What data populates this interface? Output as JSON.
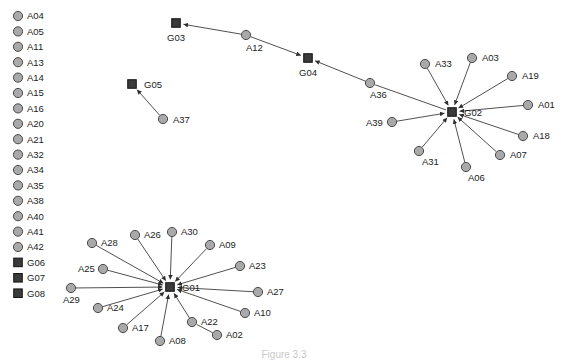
{
  "figure": {
    "type": "node-link-network-diagram",
    "background_color": "#ffffff",
    "width": 569,
    "height": 360,
    "caption": "Figure 3.3"
  },
  "style": {
    "actor_fill": "#a9a9a9",
    "actor_stroke": "#4a4a4a",
    "group_fill": "#3b3b3b",
    "group_stroke": "#1a1a1a",
    "edge_color": "#3c3c3c",
    "label_color": "#1b1b1b",
    "actor_radius": 4.6,
    "group_size": 8.5
  },
  "legend": {
    "name": "isolate-legend",
    "items": [
      {
        "label": "A04",
        "shape": "circle"
      },
      {
        "label": "A05",
        "shape": "circle"
      },
      {
        "label": "A11",
        "shape": "circle"
      },
      {
        "label": "A13",
        "shape": "circle"
      },
      {
        "label": "A14",
        "shape": "circle"
      },
      {
        "label": "A15",
        "shape": "circle"
      },
      {
        "label": "A16",
        "shape": "circle"
      },
      {
        "label": "A20",
        "shape": "circle"
      },
      {
        "label": "A21",
        "shape": "circle"
      },
      {
        "label": "A32",
        "shape": "circle"
      },
      {
        "label": "A34",
        "shape": "circle"
      },
      {
        "label": "A35",
        "shape": "circle"
      },
      {
        "label": "A38",
        "shape": "circle"
      },
      {
        "label": "A40",
        "shape": "circle"
      },
      {
        "label": "A41",
        "shape": "circle"
      },
      {
        "label": "A42",
        "shape": "circle"
      },
      {
        "label": "G06",
        "shape": "square"
      },
      {
        "label": "G07",
        "shape": "square"
      },
      {
        "label": "G08",
        "shape": "square"
      }
    ]
  },
  "chart_data": {
    "type": "network",
    "title": "",
    "directed": true,
    "nodes": [
      {
        "id": "G03",
        "label": "G03",
        "shape": "square",
        "x": 176,
        "y": 23,
        "label_dx": -9,
        "label_dy": 18
      },
      {
        "id": "A12",
        "label": "A12",
        "shape": "circle",
        "x": 246,
        "y": 35,
        "label_dx": 0,
        "label_dy": 16
      },
      {
        "id": "G04",
        "label": "G04",
        "shape": "square",
        "x": 308,
        "y": 58,
        "label_dx": -9,
        "label_dy": 18
      },
      {
        "id": "A36",
        "label": "A36",
        "shape": "circle",
        "x": 370,
        "y": 83,
        "label_dx": 0,
        "label_dy": 15
      },
      {
        "id": "G05",
        "label": "G05",
        "shape": "square",
        "x": 132,
        "y": 84,
        "label_dx": 12,
        "label_dy": 4
      },
      {
        "id": "A37",
        "label": "A37",
        "shape": "circle",
        "x": 163,
        "y": 119,
        "label_dx": 10,
        "label_dy": 4
      },
      {
        "id": "G02",
        "label": "G02",
        "shape": "square",
        "x": 452,
        "y": 112,
        "label_dx": 12,
        "label_dy": 4
      },
      {
        "id": "A33",
        "label": "A33",
        "shape": "circle",
        "x": 425,
        "y": 64,
        "label_dx": 10,
        "label_dy": 3
      },
      {
        "id": "A03",
        "label": "A03",
        "shape": "circle",
        "x": 472,
        "y": 58,
        "label_dx": 10,
        "label_dy": 3
      },
      {
        "id": "A19",
        "label": "A19",
        "shape": "circle",
        "x": 512,
        "y": 76,
        "label_dx": 10,
        "label_dy": 3
      },
      {
        "id": "A01",
        "label": "A01",
        "shape": "circle",
        "x": 528,
        "y": 105,
        "label_dx": 10,
        "label_dy": 3
      },
      {
        "id": "A18",
        "label": "A18",
        "shape": "circle",
        "x": 523,
        "y": 136,
        "label_dx": 10,
        "label_dy": 3
      },
      {
        "id": "A07",
        "label": "A07",
        "shape": "circle",
        "x": 500,
        "y": 155,
        "label_dx": 10,
        "label_dy": 3
      },
      {
        "id": "A06",
        "label": "A06",
        "shape": "circle",
        "x": 466,
        "y": 167,
        "label_dx": 2,
        "label_dy": 14
      },
      {
        "id": "A31",
        "label": "A31",
        "shape": "circle",
        "x": 419,
        "y": 151,
        "label_dx": 3,
        "label_dy": 14
      },
      {
        "id": "A39",
        "label": "A39",
        "shape": "circle",
        "x": 392,
        "y": 122,
        "label_dx": -26,
        "label_dy": 4
      },
      {
        "id": "G01",
        "label": "G01",
        "shape": "square",
        "x": 170,
        "y": 287,
        "label_dx": 12,
        "label_dy": 4
      },
      {
        "id": "A28",
        "label": "A28",
        "shape": "circle",
        "x": 92,
        "y": 243,
        "label_dx": 9,
        "label_dy": 3
      },
      {
        "id": "A26",
        "label": "A26",
        "shape": "circle",
        "x": 135,
        "y": 235,
        "label_dx": 9,
        "label_dy": 3
      },
      {
        "id": "A30",
        "label": "A30",
        "shape": "circle",
        "x": 172,
        "y": 232,
        "label_dx": 9,
        "label_dy": 3
      },
      {
        "id": "A09",
        "label": "A09",
        "shape": "circle",
        "x": 210,
        "y": 245,
        "label_dx": 9,
        "label_dy": 3
      },
      {
        "id": "A23",
        "label": "A23",
        "shape": "circle",
        "x": 240,
        "y": 266,
        "label_dx": 9,
        "label_dy": 3
      },
      {
        "id": "A27",
        "label": "A27",
        "shape": "circle",
        "x": 258,
        "y": 292,
        "label_dx": 9,
        "label_dy": 3
      },
      {
        "id": "A10",
        "label": "A10",
        "shape": "circle",
        "x": 245,
        "y": 313,
        "label_dx": 9,
        "label_dy": 3
      },
      {
        "id": "A02",
        "label": "A02",
        "shape": "circle",
        "x": 217,
        "y": 335,
        "label_dx": 9,
        "label_dy": 3
      },
      {
        "id": "A22",
        "label": "A22",
        "shape": "circle",
        "x": 192,
        "y": 322,
        "label_dx": 9,
        "label_dy": 3
      },
      {
        "id": "A08",
        "label": "A08",
        "shape": "circle",
        "x": 160,
        "y": 341,
        "label_dx": 9,
        "label_dy": 3
      },
      {
        "id": "A17",
        "label": "A17",
        "shape": "circle",
        "x": 123,
        "y": 328,
        "label_dx": 9,
        "label_dy": 3
      },
      {
        "id": "A24",
        "label": "A24",
        "shape": "circle",
        "x": 98,
        "y": 308,
        "label_dx": 9,
        "label_dy": 3
      },
      {
        "id": "A29",
        "label": "A29",
        "shape": "circle",
        "x": 71,
        "y": 288,
        "label_dx": -8,
        "label_dy": 15
      },
      {
        "id": "A25",
        "label": "A25",
        "shape": "circle",
        "x": 103,
        "y": 269,
        "label_dx": -25,
        "label_dy": 3
      }
    ],
    "edges": [
      {
        "source": "A12",
        "target": "G03",
        "arrow": true
      },
      {
        "source": "A36",
        "target": "G04",
        "arrow": true
      },
      {
        "source": "G02",
        "target": "A36",
        "arrow": false
      },
      {
        "source": "A12",
        "target": "G04",
        "arrow": true
      },
      {
        "source": "A37",
        "target": "G05",
        "arrow": true
      },
      {
        "source": "A33",
        "target": "G02",
        "arrow": true
      },
      {
        "source": "A03",
        "target": "G02",
        "arrow": true
      },
      {
        "source": "A19",
        "target": "G02",
        "arrow": true
      },
      {
        "source": "A01",
        "target": "G02",
        "arrow": true
      },
      {
        "source": "A18",
        "target": "G02",
        "arrow": true
      },
      {
        "source": "A07",
        "target": "G02",
        "arrow": true
      },
      {
        "source": "A06",
        "target": "G02",
        "arrow": true
      },
      {
        "source": "A31",
        "target": "G02",
        "arrow": true
      },
      {
        "source": "A39",
        "target": "G02",
        "arrow": true
      },
      {
        "source": "A28",
        "target": "G01",
        "arrow": true
      },
      {
        "source": "A26",
        "target": "G01",
        "arrow": true
      },
      {
        "source": "A30",
        "target": "G01",
        "arrow": true
      },
      {
        "source": "A09",
        "target": "G01",
        "arrow": true
      },
      {
        "source": "A23",
        "target": "G01",
        "arrow": true
      },
      {
        "source": "A27",
        "target": "G01",
        "arrow": true
      },
      {
        "source": "A10",
        "target": "G01",
        "arrow": true
      },
      {
        "source": "A22",
        "target": "G01",
        "arrow": true
      },
      {
        "source": "A02",
        "target": "A22",
        "arrow": false
      },
      {
        "source": "A08",
        "target": "G01",
        "arrow": true
      },
      {
        "source": "A17",
        "target": "G01",
        "arrow": true
      },
      {
        "source": "A24",
        "target": "G01",
        "arrow": true
      },
      {
        "source": "A29",
        "target": "G01",
        "arrow": true
      },
      {
        "source": "A25",
        "target": "G01",
        "arrow": true
      }
    ],
    "isolates": [
      "A04",
      "A05",
      "A11",
      "A13",
      "A14",
      "A15",
      "A16",
      "A20",
      "A21",
      "A32",
      "A34",
      "A35",
      "A38",
      "A40",
      "A41",
      "A42",
      "G06",
      "G07",
      "G08"
    ],
    "legend_position": "left",
    "grid": false
  }
}
